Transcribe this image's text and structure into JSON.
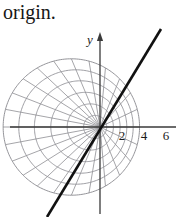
{
  "page": {
    "background_color": "#ffffff",
    "width": 193,
    "height": 217
  },
  "caption": {
    "text": "origin."
  },
  "figure": {
    "name": "polar-limacon-grid-figure",
    "colors": {
      "grid": "#8e8e93",
      "axis": "#3a3a3a",
      "bold_line": "#111111",
      "text": "#1a1a1a"
    },
    "origin": {
      "x": 100,
      "y": 127
    },
    "axes": {
      "x_axis": {
        "x1": 10,
        "y1": 127,
        "x2": 176,
        "y2": 127
      },
      "y_axis": {
        "x1": 100,
        "y1": 36,
        "x2": 100,
        "y2": 214
      },
      "y_label": "y",
      "y_arrow": true
    },
    "x_ticks": [
      {
        "label": "2",
        "x": 122
      },
      {
        "label": "4",
        "x": 144
      },
      {
        "label": "6",
        "x": 166
      }
    ],
    "unit_px": 11,
    "grid": {
      "ring_count": 6,
      "spoke_count": 24,
      "offset_ratio": 0.42,
      "max_radius_units": 6.2
    },
    "bold_line": {
      "x1": 47,
      "y1": 217,
      "x2": 161,
      "y2": 29,
      "width": 2.6
    }
  },
  "chart_data": {
    "type": "line",
    "title": "",
    "subtitle": "",
    "xlabel": "",
    "ylabel": "y",
    "xticklabels": [
      "2",
      "4",
      "6"
    ],
    "xtickvalues": [
      2,
      4,
      6
    ],
    "yticklabels": [],
    "grid": "polar-limacon",
    "legend": "none",
    "xlim": [
      -8.2,
      6.9
    ],
    "ylim": [
      -8.3,
      8.3
    ],
    "series": [
      {
        "name": "line-through-origin",
        "type": "line",
        "style": "solid-bold",
        "color": "#111111",
        "slope": -1.65,
        "intercept": 0,
        "points": [
          [
            -4.8,
            8.0
          ],
          [
            0,
            0
          ],
          [
            5.55,
            -8.2
          ]
        ]
      },
      {
        "name": "polar-grid-rings",
        "type": "family-of-curves",
        "color": "#8e8e93",
        "radii": [
          1.05,
          2.1,
          3.15,
          4.2,
          5.2,
          6.2
        ],
        "offset_ratio": 0.42
      },
      {
        "name": "polar-grid-spokes",
        "type": "radial-lines",
        "color": "#8e8e93",
        "count": 24,
        "angle_step_deg": 15
      }
    ]
  }
}
